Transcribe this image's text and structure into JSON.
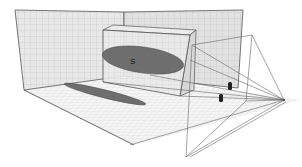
{
  "figure": {
    "object_label": "S",
    "colors": {
      "background": "#ffffff",
      "wall_fill": "#e6e6e6",
      "floor_fill": "#f4f4f4",
      "grid": "#bdbdbd",
      "edge": "#555555",
      "ellipse": "#6e6e6e",
      "marker": "#222222"
    }
  }
}
